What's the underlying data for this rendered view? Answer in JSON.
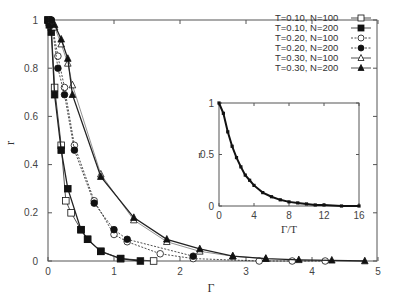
{
  "chart_data": [
    {
      "type": "line",
      "title": "",
      "xlabel": "Γ",
      "ylabel": "r",
      "xlim": [
        0,
        5
      ],
      "ylim": [
        0,
        1
      ],
      "xticks": [
        "0",
        "1",
        "2",
        "3",
        "4",
        "5"
      ],
      "yticks": [
        "0",
        "0.2",
        "0.4",
        "0.6",
        "0.8",
        "1"
      ],
      "grid": false,
      "legend_position": "upper right",
      "series": [
        {
          "name": "T=0.10, N=100",
          "marker": "open-square",
          "line": "solid",
          "x": [
            0.0,
            0.02,
            0.05,
            0.1,
            0.2,
            0.27,
            0.35,
            0.5,
            0.6,
            0.8,
            1.1,
            1.6
          ],
          "y": [
            1.0,
            0.99,
            0.97,
            0.72,
            0.48,
            0.25,
            0.2,
            0.13,
            0.09,
            0.04,
            0.01,
            0.0
          ]
        },
        {
          "name": "T=0.10, N=200",
          "marker": "filled-square",
          "line": "solid",
          "x": [
            0.0,
            0.02,
            0.05,
            0.1,
            0.2,
            0.3,
            0.5,
            0.6,
            0.8,
            1.1,
            1.4
          ],
          "y": [
            1.0,
            0.98,
            0.95,
            0.69,
            0.46,
            0.3,
            0.13,
            0.09,
            0.04,
            0.01,
            0.0
          ]
        },
        {
          "name": "T=0.20, N=100",
          "marker": "open-circle",
          "line": "dotted",
          "x": [
            0.05,
            0.15,
            0.25,
            0.4,
            0.7,
            1.0,
            1.2,
            1.7,
            2.2,
            3.2,
            3.7,
            4.2
          ],
          "y": [
            1.0,
            0.85,
            0.72,
            0.48,
            0.25,
            0.11,
            0.08,
            0.03,
            0.01,
            0.0,
            0.0,
            0.0
          ]
        },
        {
          "name": "T=0.20, N=200",
          "marker": "filled-circle",
          "line": "dotted",
          "x": [
            0.05,
            0.15,
            0.25,
            0.4,
            0.7,
            1.0,
            1.2,
            2.2
          ],
          "y": [
            1.0,
            0.8,
            0.69,
            0.46,
            0.24,
            0.13,
            0.09,
            0.02
          ]
        },
        {
          "name": "T=0.30, N=100",
          "marker": "open-triangle",
          "line": "solid-thin",
          "x": [
            0.1,
            0.2,
            0.3,
            0.37,
            0.8,
            1.3,
            1.8,
            2.3,
            2.8,
            3.3
          ],
          "y": [
            0.97,
            0.9,
            0.82,
            0.73,
            0.36,
            0.17,
            0.08,
            0.04,
            0.02,
            0.01
          ]
        },
        {
          "name": "T=0.30, N=200",
          "marker": "filled-triangle",
          "line": "solid",
          "x": [
            0.1,
            0.2,
            0.3,
            0.37,
            0.8,
            1.3,
            1.8,
            2.3,
            2.8,
            3.3,
            3.8,
            4.3,
            4.8
          ],
          "y": [
            0.98,
            0.92,
            0.84,
            0.69,
            0.35,
            0.18,
            0.09,
            0.05,
            0.02,
            0.01,
            0.005,
            0.003,
            0.0
          ]
        }
      ]
    },
    {
      "type": "line",
      "title": "inset",
      "xlabel": "Γ/T",
      "ylabel": "r",
      "xlim": [
        0,
        16
      ],
      "ylim": [
        0,
        1
      ],
      "xticks": [
        "0",
        "4",
        "8",
        "12",
        "16"
      ],
      "yticks": [
        "0",
        "0.5",
        "1"
      ],
      "grid": false,
      "series": [
        {
          "name": "collapsed data (all T, N)",
          "x": [
            0,
            0.5,
            1,
            1.5,
            2,
            2.5,
            3,
            3.5,
            4,
            5,
            6,
            7,
            8,
            9,
            10,
            11,
            12,
            14,
            16
          ],
          "y": [
            1.0,
            0.9,
            0.72,
            0.58,
            0.47,
            0.38,
            0.3,
            0.25,
            0.2,
            0.13,
            0.09,
            0.06,
            0.04,
            0.03,
            0.02,
            0.01,
            0.01,
            0.0,
            0.0
          ]
        }
      ]
    }
  ],
  "legend": {
    "entries": [
      "T=0.10, N=100",
      "T=0.10, N=200",
      "T=0.20, N=100",
      "T=0.20, N=200",
      "T=0.30, N=100",
      "T=0.30, N=200"
    ]
  },
  "axes": {
    "main": {
      "xlabel": "Γ",
      "ylabel": "r",
      "xticks": [
        "0",
        "1",
        "2",
        "3",
        "4",
        "5"
      ],
      "yticks": [
        "0",
        "0.2",
        "0.4",
        "0.6",
        "0.8",
        "1"
      ]
    },
    "inset": {
      "xlabel": "Γ/T",
      "ylabel": "r",
      "xticks": [
        "0",
        "4",
        "8",
        "12",
        "16"
      ],
      "yticks": [
        "0",
        "0.5",
        "1"
      ]
    }
  }
}
